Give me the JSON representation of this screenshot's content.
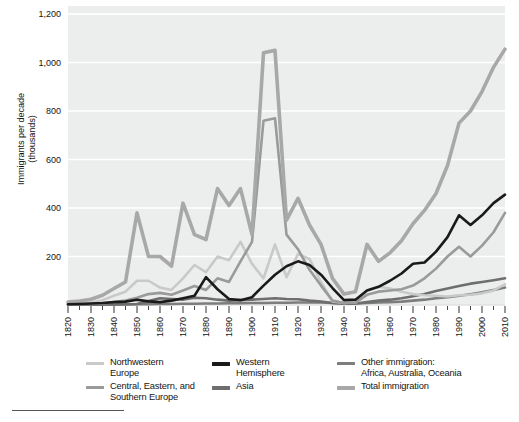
{
  "chart_data": {
    "type": "line",
    "title": "",
    "xlabel": "",
    "ylabel": "Immigrants per decade\n(thousands)",
    "ylabel_line1": "Immigrants per decade",
    "ylabel_line2": "(thousands)",
    "xlim": [
      1820,
      2010
    ],
    "ylim": [
      0,
      1200
    ],
    "ytick_values": [
      200,
      400,
      600,
      800,
      1000,
      1200
    ],
    "ytick_labels": [
      "200",
      "400",
      "600",
      "800",
      "1,000",
      "1,200"
    ],
    "xtick_values": [
      1820,
      1830,
      1840,
      1850,
      1860,
      1870,
      1880,
      1890,
      1900,
      1910,
      1920,
      1930,
      1940,
      1950,
      1960,
      1970,
      1980,
      1990,
      2000,
      2010
    ],
    "xtick_labels": [
      "1820",
      "1830",
      "1840",
      "1850",
      "1860",
      "1870",
      "1880",
      "1890",
      "1900",
      "1910",
      "1920",
      "1930",
      "1940",
      "1950",
      "1960",
      "1970",
      "1980",
      "1990",
      "2000",
      "2010"
    ],
    "grid": "horizontal-only",
    "legend_position": "below",
    "plot_bg": "#eceded",
    "gridline_color": "#ffffff",
    "x": [
      1820,
      1825,
      1830,
      1835,
      1840,
      1845,
      1850,
      1855,
      1860,
      1865,
      1870,
      1875,
      1880,
      1885,
      1890,
      1895,
      1900,
      1905,
      1910,
      1915,
      1920,
      1925,
      1930,
      1935,
      1940,
      1945,
      1950,
      1955,
      1960,
      1965,
      1970,
      1975,
      1980,
      1985,
      1990,
      1995,
      2000,
      2005,
      2010
    ],
    "series": [
      {
        "name": "Northwestern Europe",
        "color": "#c9c9c9",
        "width": 2.6,
        "values": [
          4,
          6,
          10,
          20,
          38,
          55,
          100,
          100,
          72,
          62,
          110,
          165,
          135,
          200,
          185,
          260,
          170,
          110,
          250,
          115,
          210,
          190,
          95,
          15,
          8,
          10,
          60,
          75,
          68,
          55,
          45,
          40,
          38,
          35,
          40,
          42,
          48,
          60,
          85
        ]
      },
      {
        "name": "Central, Eastern, and Southern Europe",
        "color": "#9a9a9a",
        "width": 2.6,
        "values": [
          2,
          3,
          4,
          6,
          12,
          18,
          30,
          45,
          50,
          42,
          60,
          78,
          62,
          110,
          95,
          180,
          260,
          760,
          770,
          290,
          230,
          145,
          80,
          18,
          8,
          10,
          42,
          55,
          60,
          65,
          80,
          110,
          150,
          200,
          240,
          200,
          245,
          300,
          380
        ]
      },
      {
        "name": "Western Hemisphere",
        "color": "#1a1a1a",
        "width": 2.6,
        "values": [
          3,
          4,
          6,
          8,
          12,
          14,
          22,
          15,
          12,
          18,
          28,
          38,
          115,
          65,
          25,
          20,
          32,
          80,
          125,
          160,
          180,
          165,
          125,
          70,
          20,
          22,
          60,
          75,
          100,
          130,
          170,
          175,
          220,
          280,
          370,
          330,
          370,
          420,
          455
        ]
      },
      {
        "name": "Asia",
        "color": "#6e6e6e",
        "width": 2.6,
        "values": [
          1,
          1,
          1,
          2,
          2,
          3,
          4,
          16,
          28,
          25,
          22,
          30,
          28,
          22,
          18,
          20,
          22,
          25,
          28,
          25,
          24,
          18,
          14,
          8,
          5,
          6,
          12,
          18,
          22,
          28,
          36,
          45,
          58,
          68,
          78,
          88,
          95,
          102,
          110
        ]
      },
      {
        "name": "Other immigration: Africa, Australia, Oceania",
        "color": "#7d7d7d",
        "width": 2.6,
        "values": [
          1,
          1,
          1,
          1,
          2,
          2,
          3,
          3,
          4,
          4,
          5,
          5,
          6,
          6,
          7,
          7,
          8,
          8,
          9,
          9,
          10,
          10,
          10,
          8,
          6,
          6,
          8,
          10,
          12,
          14,
          18,
          22,
          28,
          32,
          38,
          44,
          52,
          62,
          72
        ]
      },
      {
        "name": "Total immigration",
        "color": "#a8a8a8",
        "width": 3.6,
        "values": [
          12,
          16,
          24,
          40,
          68,
          95,
          380,
          200,
          200,
          160,
          420,
          290,
          270,
          480,
          410,
          480,
          290,
          1040,
          1050,
          350,
          440,
          330,
          250,
          110,
          45,
          55,
          250,
          180,
          215,
          265,
          335,
          390,
          460,
          575,
          750,
          800,
          880,
          980,
          1055
        ]
      }
    ]
  },
  "legend": {
    "items": [
      {
        "key": "nw",
        "label": "Northwestern\nEurope",
        "color": "#c9c9c9",
        "thick": false
      },
      {
        "key": "cse",
        "label": "Central, Eastern, and\nSouthern Europe",
        "color": "#9a9a9a",
        "thick": false
      },
      {
        "key": "wh",
        "label": "Western\nHemisphere",
        "color": "#1a1a1a",
        "thick": true
      },
      {
        "key": "asia",
        "label": "Asia",
        "color": "#6e6e6e",
        "thick": true
      },
      {
        "key": "oth",
        "label": "Other immigration:\nAfrica, Australia, Oceania",
        "color": "#7d7d7d",
        "thick": false
      },
      {
        "key": "tot",
        "label": "Total immigration",
        "color": "#a8a8a8",
        "thick": true
      }
    ]
  }
}
